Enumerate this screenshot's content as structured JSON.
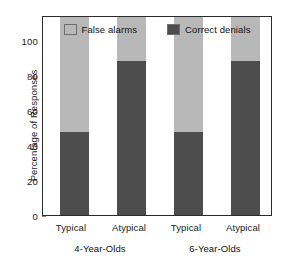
{
  "chart_data": {
    "type": "bar",
    "subtype": "stacked-bar",
    "title": "",
    "xlabel": "",
    "ylabel": "Percentage of Responses",
    "ylim": [
      0,
      100
    ],
    "yticks": [
      0,
      20,
      40,
      60,
      80,
      100
    ],
    "ytick_labels": [
      "0",
      "20",
      "40",
      "60",
      "80",
      "100"
    ],
    "grid": false,
    "legend_position": "top-inside",
    "categories": [
      "Typical",
      "Atypical",
      "Typical",
      "Atypical"
    ],
    "groups": [
      {
        "label": "4-Year-Olds",
        "categories": [
          "Typical",
          "Atypical"
        ]
      },
      {
        "label": "6-Year-Olds",
        "categories": [
          "Typical",
          "Atypical"
        ]
      }
    ],
    "series": [
      {
        "name": "Correct denials",
        "color": "#4d4d4d",
        "values": [
          42,
          78,
          42,
          78
        ]
      },
      {
        "name": "False alarms",
        "color": "#b8b8b8",
        "values": [
          58,
          22,
          58,
          22
        ]
      }
    ],
    "legend": [
      {
        "label": "False alarms",
        "color": "#b8b8b8"
      },
      {
        "label": "Correct denials",
        "color": "#4d4d4d"
      }
    ]
  },
  "axis": {
    "y_title": "Percentage of Responses",
    "tick_0": "0",
    "tick_20": "20",
    "tick_40": "40",
    "tick_60": "60",
    "tick_80": "80",
    "tick_100": "100"
  },
  "legend": {
    "item_0_label": "False alarms",
    "item_1_label": "Correct denials"
  },
  "xaxis": {
    "tick_0": "Typical",
    "tick_1": "Atypical",
    "tick_2": "Typical",
    "tick_3": "Atypical",
    "group_0": "4-Year-Olds",
    "group_1": "6-Year-Olds"
  },
  "colors": {
    "false_alarms": "#b8b8b8",
    "correct_denials": "#4d4d4d",
    "frame": "#2b2b2b",
    "text": "#1a1a1a",
    "background": "#ffffff"
  }
}
